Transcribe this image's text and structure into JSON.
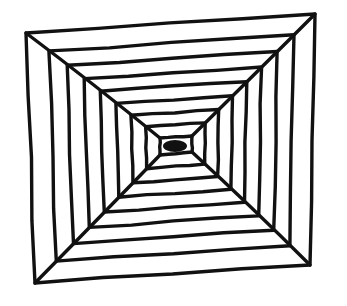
{
  "drawing": {
    "subject": "hand-drawn concentric squares tunnel",
    "stroke_color": "#111111",
    "background_color": "#ffffff",
    "stroke_width": 3.4,
    "outer_corners": {
      "top_left": [
        26,
        33
      ],
      "top_right": [
        315,
        14
      ],
      "bottom_right": [
        310,
        265
      ],
      "bottom_left": [
        35,
        283
      ]
    },
    "inner_corners": {
      "top_left": [
        160,
        138
      ],
      "top_right": [
        192,
        136
      ],
      "bottom_right": [
        192,
        152
      ],
      "bottom_left": [
        160,
        155
      ]
    },
    "center": [
      175,
      146
    ],
    "ring_count": 9,
    "diagonals": 4
  }
}
